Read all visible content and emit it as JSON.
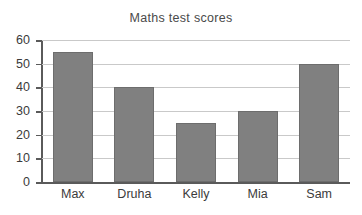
{
  "chart_data": {
    "type": "bar",
    "title": "Maths test scores",
    "categories": [
      "Max",
      "Druha",
      "Kelly",
      "Mia",
      "Sam"
    ],
    "values": [
      55,
      40,
      25,
      30,
      50
    ],
    "xlabel": "",
    "ylabel": "",
    "ylim": [
      0,
      60
    ],
    "ytick_labels": [
      "60",
      "50",
      "40",
      "30",
      "20",
      "10",
      "0"
    ],
    "ytick_values": [
      60,
      50,
      40,
      30,
      20,
      10,
      0
    ],
    "ytick_step": 10,
    "grid": true,
    "legend": null,
    "bar_color": "#808080",
    "bar_border_color": "#6d6d6d",
    "gridline_color": "#c9c9c9",
    "axis_color": "#5a5a5a",
    "text_color": "#3b3b3b",
    "title_color": "#4a4a4a",
    "background_color": "#ffffff"
  }
}
